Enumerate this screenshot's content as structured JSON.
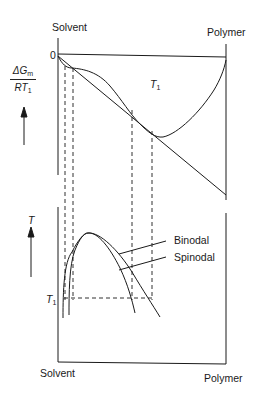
{
  "diagram": {
    "top_panel": {
      "left_label": "Solvent",
      "right_label": "Polymer",
      "zero_label": "0",
      "y_axis_label_num": "ΔG",
      "y_axis_label_num_sub": "m",
      "y_axis_label_den": "RT",
      "y_axis_label_den_sub": "1",
      "curve_label": "T",
      "curve_label_sub": "1"
    },
    "bottom_panel": {
      "left_label": "Solvent",
      "right_label": "Polymer",
      "y_axis_label": "T",
      "t1_label": "T",
      "t1_label_sub": "1",
      "binodal_label": "Binodal",
      "spinodal_label": "Spinodal"
    },
    "colors": {
      "line": "#1a1a1a",
      "background": "#ffffff"
    }
  }
}
